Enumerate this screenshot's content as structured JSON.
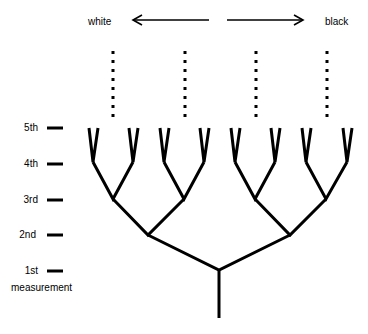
{
  "direction": {
    "left_label": "white",
    "right_label": "black"
  },
  "levels": [
    {
      "label": "5th"
    },
    {
      "label": "4th"
    },
    {
      "label": "3rd"
    },
    {
      "label": "2nd"
    },
    {
      "label": "1st"
    }
  ],
  "axis_caption": "measurement",
  "diagram": {
    "type": "binary branching tree",
    "levels_count": 5,
    "continuation": "dotted lines above 3rd-level branches",
    "line_color": "#000000",
    "background": "#ffffff"
  }
}
